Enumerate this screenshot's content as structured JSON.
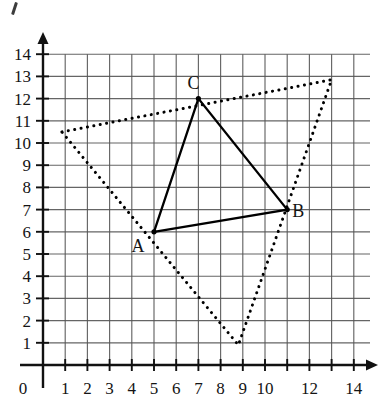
{
  "figure": {
    "background_color": "#ffffff",
    "grid_color": "#555555",
    "axis_color": "#111111",
    "solid_shape_color": "#000000",
    "dotted_shape_color": "#000000"
  },
  "axes": {
    "origin_label": "0",
    "x_labels": [
      "1",
      "2",
      "3",
      "4",
      "5",
      "6",
      "7",
      "8",
      "9",
      "10",
      "12",
      "14"
    ],
    "x_label_values": [
      1,
      2,
      3,
      4,
      5,
      6,
      7,
      8,
      9,
      10,
      12,
      14
    ],
    "y_labels": [
      "1",
      "2",
      "3",
      "4",
      "5",
      "6",
      "7",
      "8",
      "9",
      "10",
      "11",
      "12",
      "13",
      "14"
    ],
    "y_label_values": [
      1,
      2,
      3,
      4,
      5,
      6,
      7,
      8,
      9,
      10,
      11,
      12,
      13,
      14
    ],
    "x_tick_values": [
      1,
      2,
      3,
      4,
      5,
      6,
      7,
      8,
      9,
      10,
      11,
      12,
      13,
      14
    ],
    "y_tick_values": [
      1,
      2,
      3,
      4,
      5,
      6,
      7,
      8,
      9,
      10,
      11,
      12,
      13,
      14
    ],
    "xlim": [
      0,
      14
    ],
    "ylim": [
      0,
      14
    ],
    "x_arrow": true,
    "y_arrow": true
  },
  "chart_data": {
    "type": "scatter",
    "title": "",
    "xlabel": "",
    "ylabel": "",
    "xlim": [
      0,
      14
    ],
    "ylim": [
      0,
      14
    ],
    "grid": true,
    "grid_step": 1,
    "legend": "none",
    "series": [
      {
        "name": "Triangle ABC (solid)",
        "style": "solid",
        "closed": true,
        "points": [
          {
            "label": "A",
            "x": 5,
            "y": 6
          },
          {
            "label": "B",
            "x": 11,
            "y": 7
          },
          {
            "label": "C",
            "x": 7,
            "y": 12
          }
        ]
      },
      {
        "name": "Enlarged triangle (dotted)",
        "style": "dotted",
        "closed": true,
        "points": [
          {
            "label": "",
            "x": 0.85,
            "y": 10.5
          },
          {
            "label": "",
            "x": 13.0,
            "y": 12.85
          },
          {
            "label": "",
            "x": 8.8,
            "y": 0.9
          }
        ]
      }
    ],
    "annotations": [
      {
        "text": "A",
        "x": 5,
        "y": 6,
        "dx": -16,
        "dy": 20
      },
      {
        "text": "B",
        "x": 11,
        "y": 7,
        "dx": 11,
        "dy": 7
      },
      {
        "text": "C",
        "x": 7,
        "y": 12,
        "dx": -5,
        "dy": -10
      }
    ]
  }
}
